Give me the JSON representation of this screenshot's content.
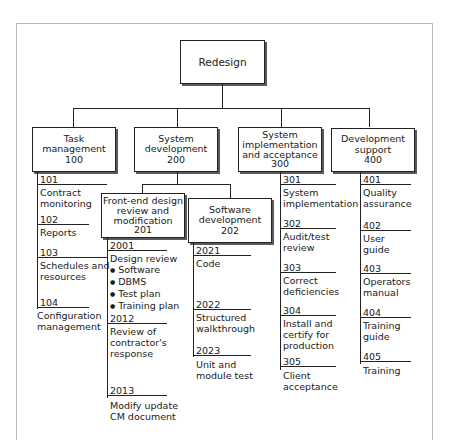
{
  "diagram": {
    "type": "work-breakdown-structure",
    "root": {
      "label": "Redesign"
    },
    "level1": [
      {
        "label_lines": [
          "Task",
          "management",
          "100"
        ],
        "tasks": [
          {
            "code": "101",
            "lines": [
              "Contract",
              "monitoring"
            ]
          },
          {
            "code": "102",
            "lines": [
              "Reports"
            ]
          },
          {
            "code": "103",
            "lines": [
              "Schedules and",
              "resources"
            ]
          },
          {
            "code": "104",
            "lines": [
              "Configuration",
              "management"
            ]
          }
        ]
      },
      {
        "label_lines": [
          "System",
          "development",
          "200"
        ],
        "children": [
          {
            "label_lines": [
              "Front-end design",
              "review and",
              "modification",
              "201"
            ],
            "tasks": [
              {
                "code": "2001",
                "lines": [
                  "Design review"
                ],
                "bullets": [
                  "Software",
                  "DBMS",
                  "Test plan",
                  "Training plan"
                ]
              },
              {
                "code": "2012",
                "lines": [
                  "Review of",
                  "contractor's",
                  "response"
                ]
              },
              {
                "code": "2013",
                "lines": [
                  "Modify update",
                  "CM document"
                ]
              }
            ]
          },
          {
            "label_lines": [
              "Software",
              "development",
              "202"
            ],
            "tasks": [
              {
                "code": "2021",
                "lines": [
                  "Code"
                ]
              },
              {
                "code": "2022",
                "lines": [
                  "Structured",
                  "walkthrough"
                ]
              },
              {
                "code": "2023",
                "lines": [
                  "Unit and",
                  "module test"
                ]
              }
            ]
          }
        ]
      },
      {
        "label_lines": [
          "System",
          "implementation",
          "and acceptance",
          "300"
        ],
        "tasks": [
          {
            "code": "301",
            "lines": [
              "System",
              "implementation"
            ]
          },
          {
            "code": "302",
            "lines": [
              "Audit/test",
              "review"
            ]
          },
          {
            "code": "303",
            "lines": [
              "Correct",
              "deficiencies"
            ]
          },
          {
            "code": "304",
            "lines": [
              "Install and",
              "certify for",
              "production"
            ]
          },
          {
            "code": "305",
            "lines": [
              "Client",
              "acceptance"
            ]
          }
        ]
      },
      {
        "label_lines": [
          "Development",
          "support",
          "400"
        ],
        "tasks": [
          {
            "code": "401",
            "lines": [
              "Quality",
              "assurance"
            ]
          },
          {
            "code": "402",
            "lines": [
              "User",
              "guide"
            ]
          },
          {
            "code": "403",
            "lines": [
              "Operators",
              "manual"
            ]
          },
          {
            "code": "404",
            "lines": [
              "Training",
              "guide"
            ]
          },
          {
            "code": "405",
            "lines": [
              "Training"
            ]
          }
        ]
      }
    ]
  },
  "colors": {
    "line": "#222222",
    "shadow": "#5a5a5a",
    "frame": "#b9b9b9",
    "background": "#ffffff"
  }
}
